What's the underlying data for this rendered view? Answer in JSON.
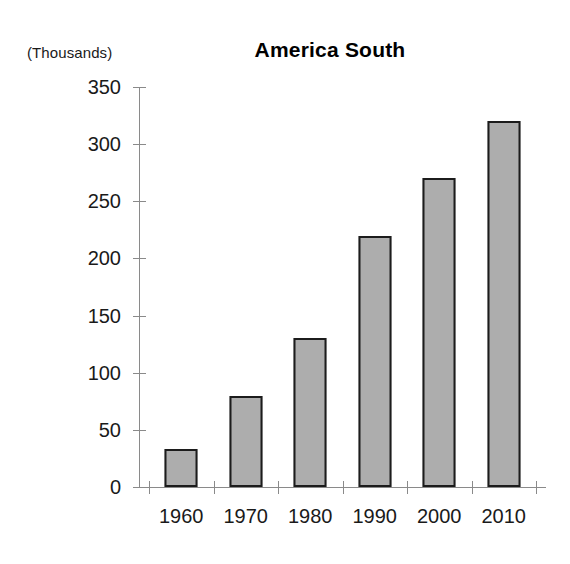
{
  "chart_data": {
    "type": "bar",
    "title": "America South",
    "unit_caption": "(Thousands)",
    "xlabel": "",
    "ylabel": "",
    "categories": [
      "1960",
      "1970",
      "1980",
      "1990",
      "2000",
      "2010"
    ],
    "values": [
      33,
      80,
      130,
      220,
      270,
      320
    ],
    "yticks": [
      0,
      50,
      100,
      150,
      200,
      250,
      300,
      350
    ],
    "ytick_labels": [
      "0",
      "50",
      "100",
      "150",
      "200",
      "250",
      "300",
      "350"
    ],
    "ylim": [
      0,
      350
    ],
    "grid": false,
    "legend": null,
    "series": [
      {
        "name": "America South",
        "values": [
          33,
          80,
          130,
          220,
          270,
          320
        ]
      }
    ],
    "colors": {
      "bar_fill": "#adadad",
      "bar_border": "#1c1c1c",
      "axis": "#8a8a8a",
      "text": "#1a1a1a",
      "background": "#ffffff"
    }
  }
}
